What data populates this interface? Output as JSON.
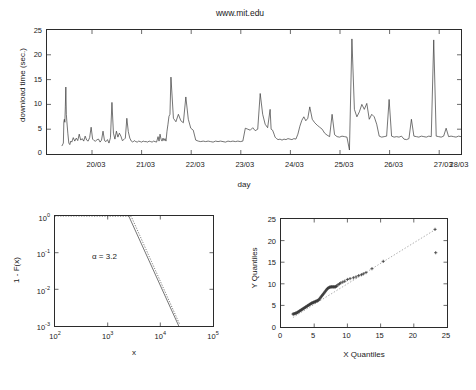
{
  "figure": {
    "background": "#ffffff",
    "panels": [
      "timeseries",
      "tail-distribution",
      "qq-plot"
    ]
  },
  "chart_data": [
    {
      "id": "timeseries",
      "type": "line",
      "title": "www.mit.edu",
      "xlabel": "day",
      "ylabel": "download time (sec.)",
      "xlim": [
        0,
        8.35
      ],
      "ylim": [
        0,
        25
      ],
      "yticks": [
        0,
        5,
        10,
        15,
        20,
        25
      ],
      "xtick_labels": [
        "20/03",
        "21/03",
        "22/03",
        "23/03",
        "24/03",
        "25/03",
        "26/03",
        "27/03",
        "28/03"
      ],
      "xtick_values": [
        0.35,
        1.35,
        2.35,
        3.35,
        4.35,
        5.35,
        6.35,
        7.35,
        8.35
      ],
      "grid": false,
      "legend": false,
      "series": [
        {
          "name": "download time",
          "x": [
            0.3,
            0.33,
            0.34,
            0.35,
            0.36,
            0.37,
            0.38,
            0.39,
            0.4,
            0.42,
            0.44,
            0.46,
            0.48,
            0.5,
            0.53,
            0.56,
            0.59,
            0.62,
            0.65,
            0.68,
            0.71,
            0.74,
            0.77,
            0.8,
            0.83,
            0.86,
            0.89,
            0.92,
            0.95,
            0.98,
            1.01,
            1.04,
            1.07,
            1.1,
            1.13,
            1.16,
            1.19,
            1.22,
            1.25,
            1.28,
            1.31,
            1.34,
            1.37,
            1.4,
            1.43,
            1.46,
            1.49,
            1.52,
            1.55,
            1.58,
            1.61,
            1.64,
            1.67,
            1.7,
            1.73,
            1.76,
            1.79,
            1.82,
            1.85,
            1.88,
            1.91,
            1.94,
            1.97,
            2.0,
            2.03,
            2.06,
            2.09,
            2.12,
            2.15,
            2.18,
            2.21,
            2.24,
            2.26,
            2.28,
            2.3,
            2.32,
            2.34,
            2.36,
            2.38,
            2.4,
            2.42,
            2.44,
            2.46,
            2.48,
            2.5,
            2.55,
            2.6,
            2.65,
            2.7,
            2.75,
            2.8,
            2.85,
            2.9,
            2.95,
            3.0,
            3.05,
            3.1,
            3.15,
            3.2,
            3.25,
            3.3,
            3.35,
            3.4,
            3.45,
            3.5,
            3.55,
            3.6,
            3.65,
            3.7,
            3.75,
            3.8,
            3.85,
            3.9,
            3.95,
            4.0,
            4.05,
            4.1,
            4.15,
            4.2,
            4.25,
            4.3,
            4.35,
            4.4,
            4.45,
            4.5,
            4.52,
            4.55,
            4.58,
            4.6,
            4.63,
            4.66,
            4.7,
            4.74,
            4.78,
            4.82,
            4.86,
            4.9,
            4.94,
            4.98,
            5.02,
            5.06,
            5.1,
            5.14,
            5.18,
            5.22,
            5.26,
            5.3,
            5.35,
            5.4,
            5.45,
            5.5,
            5.55,
            5.6,
            5.65,
            5.7,
            5.75,
            5.8,
            5.85,
            5.9,
            5.95,
            6.0,
            6.05,
            6.1,
            6.15,
            6.2,
            6.25,
            6.3,
            6.35,
            6.4,
            6.45,
            6.5,
            6.55,
            6.6,
            6.65,
            6.7,
            6.75,
            6.8,
            6.85,
            6.9,
            6.95,
            7.0,
            7.05,
            7.1,
            7.15,
            7.2,
            7.25,
            7.3,
            7.35,
            7.4,
            7.45,
            7.5,
            7.55,
            7.6,
            7.65,
            7.7,
            7.75,
            7.8,
            7.85,
            7.9,
            7.95,
            8.0,
            8.05,
            8.1,
            8.15,
            8.2,
            8.25,
            8.3,
            8.35
          ],
          "y": [
            1.6,
            2.2,
            6.5,
            7.0,
            6.4,
            9.5,
            13.5,
            8.0,
            6.6,
            4.2,
            2.2,
            1.9,
            2.6,
            2.4,
            3.3,
            2.6,
            3.2,
            2.7,
            4.0,
            2.8,
            3.1,
            2.6,
            3.6,
            2.8,
            2.6,
            3.3,
            5.4,
            3.0,
            2.7,
            2.6,
            2.9,
            3.0,
            2.4,
            2.8,
            4.6,
            2.7,
            2.5,
            2.9,
            2.2,
            3.3,
            10.4,
            4.2,
            3.0,
            4.6,
            3.4,
            4.2,
            3.6,
            2.7,
            2.9,
            3.2,
            7.2,
            4.5,
            3.2,
            2.6,
            2.4,
            2.7,
            2.5,
            2.4,
            2.6,
            2.5,
            2.4,
            2.6,
            2.5,
            2.5,
            2.4,
            2.6,
            2.5,
            2.4,
            2.6,
            2.5,
            2.4,
            3.5,
            2.6,
            4.0,
            3.0,
            2.6,
            3.2,
            2.7,
            3.1,
            2.6,
            4.6,
            6.0,
            7.6,
            8.0,
            15.5,
            7.2,
            6.5,
            8.0,
            6.7,
            6.3,
            11.5,
            7.0,
            5.2,
            4.8,
            2.8,
            2.6,
            2.5,
            2.6,
            2.5,
            2.6,
            2.5,
            2.4,
            2.6,
            2.5,
            2.6,
            2.5,
            2.4,
            2.6,
            2.5,
            2.6,
            2.5,
            2.6,
            2.5,
            2.6,
            5.2,
            5.0,
            4.8,
            5.3,
            4.7,
            5.0,
            12.2,
            8.0,
            6.0,
            5.3,
            9.0,
            5.0,
            4.8,
            4.0,
            3.4,
            3.1,
            2.9,
            3.0,
            2.8,
            3.0,
            2.9,
            3.1,
            3.0,
            2.9,
            3.1,
            3.0,
            4.0,
            5.6,
            6.8,
            7.5,
            6.7,
            7.2,
            9.5,
            7.0,
            6.3,
            5.8,
            5.4,
            5.0,
            4.2,
            3.8,
            3.5,
            8.0,
            3.9,
            3.5,
            3.4,
            3.6,
            3.5,
            3.4,
            0.8,
            23.2,
            9.0,
            7.5,
            8.5,
            10.0,
            9.0,
            10.2,
            7.0,
            8.0,
            7.5,
            6.0,
            3.6,
            3.4,
            3.5,
            3.6,
            11.0,
            3.6,
            3.4,
            3.5,
            3.4,
            3.6,
            3.0,
            2.9,
            3.1,
            7.0,
            3.6,
            3.5,
            3.4,
            3.6,
            3.5,
            3.4,
            3.6,
            3.5,
            23.0,
            3.6,
            3.5,
            3.4,
            3.6,
            5.2,
            3.5,
            3.6,
            3.5,
            3.4,
            3.6,
            3.5,
            3.4,
            3.6,
            3.5,
            3.4,
            3.6,
            3.5,
            3.6,
            4.0,
            3.9,
            5.5,
            3.8,
            5.0,
            3.7,
            12.5,
            4.0,
            10.2,
            3.8
          ]
        }
      ]
    },
    {
      "id": "tail-distribution",
      "type": "line",
      "title": "",
      "xlabel": "x",
      "ylabel": "1 - F(x)",
      "xlim_log10": [
        2,
        5
      ],
      "ylim_log10": [
        -3,
        0
      ],
      "xtick_labels": [
        "10",
        "10",
        "10",
        "10"
      ],
      "xtick_exponents": [
        "2",
        "3",
        "4",
        "5"
      ],
      "ytick_labels": [
        "10",
        "10",
        "10",
        "10"
      ],
      "ytick_exponents": [
        "0",
        "-1",
        "-2",
        "-3"
      ],
      "annotation": "α = 3.2",
      "grid": false,
      "legend": false,
      "series": [
        {
          "name": "empirical tail",
          "style": "dotted",
          "comment": "flat near 1-F(x)=1 from x=10^2 to ~10^3.45, then steep power-law decay"
        },
        {
          "name": "power-law fit",
          "style": "line",
          "slope": -3.2
        }
      ]
    },
    {
      "id": "qq-plot",
      "type": "scatter",
      "title": "",
      "xlabel": "X Quantiles",
      "ylabel": "Y Quantiles",
      "xlim": [
        0,
        25
      ],
      "ylim": [
        0,
        25
      ],
      "xticks": [
        0,
        5,
        10,
        15,
        20,
        25
      ],
      "yticks": [
        0,
        5,
        10,
        15,
        20,
        25
      ],
      "grid": false,
      "legend": false,
      "marker": "+",
      "reference_line": {
        "style": "dotted",
        "from": [
          1.8,
          2.2
        ],
        "to": [
          23.5,
          22.8
        ]
      },
      "points_x": [
        1.8,
        1.9,
        2.0,
        2.1,
        2.2,
        2.3,
        2.4,
        2.5,
        2.6,
        2.7,
        2.8,
        2.9,
        3.0,
        3.1,
        3.2,
        3.3,
        3.4,
        3.5,
        3.6,
        3.7,
        3.8,
        3.9,
        4.0,
        4.1,
        4.2,
        4.3,
        4.4,
        4.5,
        4.6,
        4.7,
        4.8,
        4.9,
        5.0,
        5.1,
        5.2,
        5.3,
        5.4,
        5.5,
        5.6,
        5.7,
        5.8,
        5.9,
        6.0,
        6.1,
        6.2,
        6.3,
        6.4,
        6.5,
        6.6,
        6.7,
        6.8,
        6.9,
        7.0,
        7.1,
        7.2,
        7.3,
        7.4,
        7.5,
        7.6,
        7.7,
        7.8,
        7.9,
        8.0,
        8.1,
        8.2,
        8.3,
        8.4,
        8.6,
        8.8,
        9.0,
        9.3,
        9.6,
        10.0,
        10.4,
        10.9,
        11.3,
        11.7,
        12.1,
        12.4,
        12.8,
        13.7,
        15.4,
        23.2,
        23.3
      ],
      "points_y": [
        3.0,
        3.0,
        3.1,
        3.1,
        3.2,
        3.2,
        3.3,
        3.4,
        3.5,
        3.6,
        3.7,
        3.8,
        3.9,
        4.0,
        4.1,
        4.2,
        4.3,
        4.4,
        4.5,
        4.6,
        4.7,
        4.8,
        4.9,
        5.0,
        5.1,
        5.2,
        5.3,
        5.4,
        5.5,
        5.6,
        5.6,
        5.7,
        5.8,
        5.8,
        5.9,
        6.0,
        6.0,
        6.1,
        6.2,
        6.3,
        6.5,
        6.7,
        6.9,
        7.1,
        7.3,
        7.5,
        7.7,
        7.9,
        8.1,
        8.3,
        8.5,
        8.7,
        8.9,
        9.0,
        9.1,
        9.2,
        9.2,
        9.3,
        9.3,
        9.3,
        9.3,
        9.3,
        9.3,
        9.3,
        9.3,
        9.4,
        9.5,
        9.8,
        10.0,
        10.2,
        10.4,
        10.6,
        11.0,
        11.2,
        11.4,
        11.6,
        11.9,
        12.1,
        12.3,
        12.6,
        13.5,
        15.2,
        22.6,
        17.2
      ]
    }
  ],
  "labels": {
    "timeseries_title": "www.mit.edu",
    "timeseries_xlabel": "day",
    "timeseries_ylabel": "download time (sec.)",
    "tail_xlabel": "x",
    "tail_ylabel": "1 - F(x)",
    "tail_annotation": "α = 3.2",
    "qq_xlabel": "X Quantiles",
    "qq_ylabel": "Y Quantiles",
    "ts_y_0": "0",
    "ts_y_5": "5",
    "ts_y_10": "10",
    "ts_y_15": "15",
    "ts_y_20": "20",
    "ts_y_25": "25",
    "ts_x_0": "20/03",
    "ts_x_1": "21/03",
    "ts_x_2": "22/03",
    "ts_x_3": "23/03",
    "ts_x_4": "24/03",
    "ts_x_5": "25/03",
    "ts_x_6": "26/03",
    "ts_x_7": "27/03",
    "ts_x_8": "28/03",
    "ten": "10",
    "exp_0": "0",
    "exp_m1": "-1",
    "exp_m2": "-2",
    "exp_m3": "-3",
    "exp_2": "2",
    "exp_3": "3",
    "exp_4": "4",
    "exp_5": "5",
    "qq_0": "0",
    "qq_5": "5",
    "qq_10": "10",
    "qq_15": "15",
    "qq_20": "20",
    "qq_25": "25"
  }
}
